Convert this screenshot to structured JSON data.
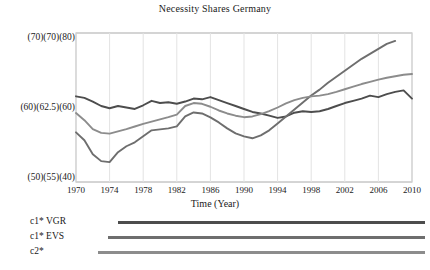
{
  "chart_data": {
    "type": "line",
    "title": "Necessity Shares Germany",
    "xlabel": "Time (Year)",
    "ylabel": "",
    "grid": true,
    "legend_position": "below",
    "x": [
      1970,
      1971,
      1972,
      1973,
      1974,
      1975,
      1976,
      1977,
      1978,
      1979,
      1980,
      1981,
      1982,
      1983,
      1984,
      1985,
      1986,
      1987,
      1988,
      1989,
      1990,
      1991,
      1992,
      1993,
      1994,
      1995,
      1996,
      1997,
      1998,
      1999,
      2000,
      2001,
      2002,
      2003,
      2004,
      2005,
      2006,
      2007,
      2008,
      2009,
      2010
    ],
    "xticks": [
      1970,
      1974,
      1978,
      1982,
      1986,
      1990,
      1994,
      1998,
      2002,
      2006,
      2010
    ],
    "xlim": [
      1970,
      2010
    ],
    "axes": [
      {
        "name": "axis-left-1",
        "series": "c1* VGR",
        "ticks": [
          50,
          60,
          70
        ],
        "ylim": [
          50,
          70
        ]
      },
      {
        "name": "axis-left-2",
        "series": "c1* EVS",
        "ticks": [
          55,
          62.5,
          70
        ],
        "ylim": [
          55,
          70
        ]
      },
      {
        "name": "axis-left-3",
        "series": "c2*",
        "ticks": [
          40,
          60,
          80
        ],
        "ylim": [
          40,
          80
        ]
      }
    ],
    "ytick_rows": [
      {
        "top": "(70)",
        "mid": "(70)",
        "bot": "(80)"
      },
      {
        "top": "(60)",
        "mid": "(62.5)",
        "bot": "(60)"
      },
      {
        "top": "(50)",
        "mid": "(55)",
        "bot": "(40)"
      }
    ],
    "ytick_labels_top": [
      "(70)",
      "(70)",
      "(80)"
    ],
    "ytick_labels_mid": [
      "(60)",
      "(62.5)",
      "(60)"
    ],
    "ytick_labels_bottom": [
      "(50)",
      "(55)",
      "(40)"
    ],
    "series": [
      {
        "name": "c1* VGR",
        "color": "#4d4d4d",
        "axis": 0,
        "values": [
          61.5,
          61.3,
          60.8,
          60.2,
          59.9,
          60.2,
          60.0,
          59.8,
          60.3,
          60.9,
          60.6,
          60.7,
          60.5,
          60.8,
          61.2,
          61.1,
          61.4,
          61.0,
          60.6,
          60.2,
          59.8,
          59.4,
          59.2,
          58.9,
          58.6,
          58.8,
          59.3,
          59.5,
          59.4,
          59.5,
          59.8,
          60.2,
          60.6,
          60.9,
          61.2,
          61.6,
          61.4,
          61.8,
          62.1,
          62.3,
          61.2
        ]
      },
      {
        "name": "c1* EVS",
        "color": "#6e6e6e",
        "axis": 1,
        "values": [
          60.0,
          59.2,
          57.8,
          57.1,
          57.0,
          58.0,
          58.6,
          59.0,
          59.6,
          60.2,
          60.3,
          60.4,
          60.6,
          61.6,
          62.0,
          61.9,
          61.5,
          61.0,
          60.4,
          59.9,
          59.6,
          59.4,
          59.7,
          60.2,
          60.9,
          61.6,
          62.3,
          63.0,
          63.7,
          64.3,
          65.0,
          65.6,
          66.2,
          66.8,
          67.4,
          67.9,
          68.4,
          68.9,
          69.2,
          null,
          null
        ]
      },
      {
        "name": "c2*",
        "color": "#8c8c8c",
        "axis": 2,
        "values": [
          58.5,
          56.6,
          54.2,
          53.2,
          53.0,
          53.6,
          54.2,
          54.9,
          55.6,
          56.2,
          56.8,
          57.4,
          58.1,
          60.4,
          61.2,
          61.0,
          60.2,
          59.2,
          58.4,
          57.8,
          57.4,
          57.6,
          58.2,
          59.0,
          60.0,
          61.1,
          62.0,
          62.6,
          63.0,
          63.2,
          63.6,
          64.2,
          64.9,
          65.6,
          66.3,
          66.9,
          67.5,
          68.0,
          68.4,
          68.8,
          69.0
        ]
      }
    ],
    "legend": [
      {
        "label": "c1* VGR",
        "color": "#4d4d4d"
      },
      {
        "label": "c1* EVS",
        "color": "#6e6e6e"
      },
      {
        "label": "c2*",
        "color": "#8c8c8c"
      }
    ]
  }
}
